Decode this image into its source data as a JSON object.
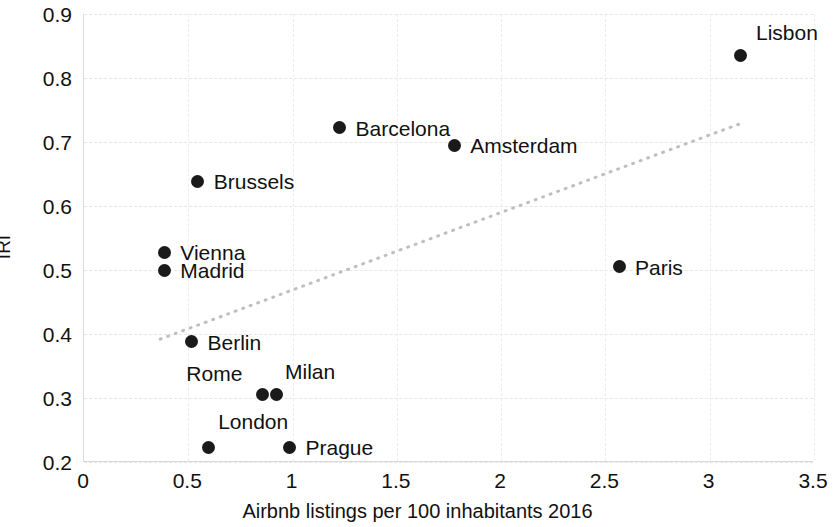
{
  "chart_data": {
    "type": "scatter",
    "title": "",
    "xlabel": "Airbnb listings per 100 inhabitants 2016",
    "ylabel": "IRI",
    "xlim": [
      0,
      3.5
    ],
    "ylim": [
      0.2,
      0.9
    ],
    "xticks": [
      "0",
      "0.5",
      "1",
      "1.5",
      "2",
      "2.5",
      "3",
      "3.5"
    ],
    "xtick_values": [
      0,
      0.5,
      1,
      1.5,
      2,
      2.5,
      3,
      3.5
    ],
    "yticks": [
      "0.2",
      "0.3",
      "0.4",
      "0.5",
      "0.6",
      "0.7",
      "0.8",
      "0.9"
    ],
    "ytick_values": [
      0.2,
      0.3,
      0.4,
      0.5,
      0.6,
      0.7,
      0.8,
      0.9
    ],
    "grid": true,
    "legend": "none",
    "marker_color": "#1a1a1a",
    "trendline": {
      "style": "dotted",
      "color": "#bfbfbf",
      "x_start": 0.37,
      "y_start": 0.392,
      "x_end": 3.17,
      "y_end": 0.731
    },
    "points": [
      {
        "label": "Lisbon",
        "x": 3.15,
        "y": 0.835,
        "label_dx": 16,
        "label_dy": -24
      },
      {
        "label": "Barcelona",
        "x": 1.23,
        "y": 0.722,
        "label_dx": 16,
        "label_dy": 0
      },
      {
        "label": "Amsterdam",
        "x": 1.78,
        "y": 0.695,
        "label_dx": 16,
        "label_dy": 0
      },
      {
        "label": "Brussels",
        "x": 0.55,
        "y": 0.639,
        "label_dx": 16,
        "label_dy": 0
      },
      {
        "label": "Vienna",
        "x": 0.39,
        "y": 0.528,
        "label_dx": 16,
        "label_dy": 0
      },
      {
        "label": "Madrid",
        "x": 0.39,
        "y": 0.5,
        "label_dx": 16,
        "label_dy": 0
      },
      {
        "label": "Paris",
        "x": 2.57,
        "y": 0.505,
        "label_dx": 16,
        "label_dy": 0
      },
      {
        "label": "Berlin",
        "x": 0.52,
        "y": 0.388,
        "label_dx": 16,
        "label_dy": 0
      },
      {
        "label": "Rome",
        "x": 0.86,
        "y": 0.305,
        "label_dx": -76,
        "label_dy": -22
      },
      {
        "label": "Milan",
        "x": 0.93,
        "y": 0.305,
        "label_dx": 8,
        "label_dy": -24
      },
      {
        "label": "London",
        "x": 0.6,
        "y": 0.223,
        "label_dx": 10,
        "label_dy": -26
      },
      {
        "label": "Prague",
        "x": 0.99,
        "y": 0.223,
        "label_dx": 16,
        "label_dy": 0
      }
    ]
  }
}
